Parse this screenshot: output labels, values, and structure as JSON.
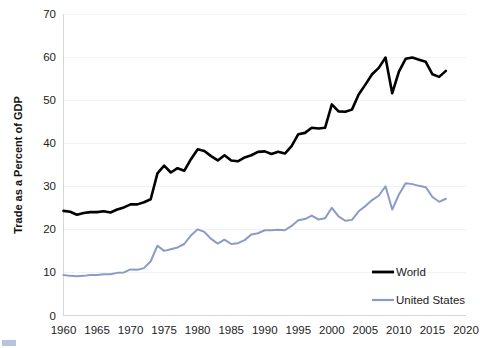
{
  "chart_data": {
    "type": "line",
    "title": "",
    "subtitle": "",
    "xlabel": "",
    "ylabel": "Trade as a Percent of GDP",
    "xlim": [
      1960,
      2020
    ],
    "ylim": [
      0,
      70
    ],
    "x_ticks": [
      1960,
      1965,
      1970,
      1975,
      1980,
      1985,
      1990,
      1995,
      2000,
      2005,
      2010,
      2015,
      2020
    ],
    "y_ticks": [
      0,
      10,
      20,
      30,
      40,
      50,
      60,
      70
    ],
    "grid": true,
    "legend_position": "inside-bottom-right",
    "x": [
      1960,
      1961,
      1962,
      1963,
      1964,
      1965,
      1966,
      1967,
      1968,
      1969,
      1970,
      1971,
      1972,
      1973,
      1974,
      1975,
      1976,
      1977,
      1978,
      1979,
      1980,
      1981,
      1982,
      1983,
      1984,
      1985,
      1986,
      1987,
      1988,
      1989,
      1990,
      1991,
      1992,
      1993,
      1994,
      1995,
      1996,
      1997,
      1998,
      1999,
      2000,
      2001,
      2002,
      2003,
      2004,
      2005,
      2006,
      2007,
      2008,
      2009,
      2010,
      2011,
      2012,
      2013,
      2014,
      2015,
      2016,
      2017
    ],
    "series": [
      {
        "name": "World",
        "color": "#000000",
        "values": [
          24.3,
          24.1,
          23.4,
          23.8,
          24.0,
          24.0,
          24.2,
          23.9,
          24.6,
          25.1,
          25.8,
          25.8,
          26.3,
          27.0,
          33.0,
          34.8,
          33.2,
          34.2,
          33.6,
          36.3,
          38.6,
          38.2,
          37.0,
          36.0,
          37.2,
          36.0,
          35.8,
          36.7,
          37.2,
          38.0,
          38.1,
          37.5,
          38.0,
          37.6,
          39.3,
          42.1,
          42.4,
          43.6,
          43.4,
          43.6,
          49.0,
          47.4,
          47.3,
          47.8,
          51.3,
          53.6,
          56.0,
          57.5,
          59.9,
          51.6,
          56.6,
          59.6,
          59.9,
          59.4,
          58.9,
          56.0,
          55.4,
          56.8
        ]
      },
      {
        "name": "United States",
        "color": "#8a9bc8",
        "values": [
          9.4,
          9.2,
          9.1,
          9.2,
          9.4,
          9.4,
          9.6,
          9.6,
          9.9,
          10.0,
          10.7,
          10.6,
          11.0,
          12.6,
          16.2,
          15.0,
          15.4,
          15.8,
          16.6,
          18.6,
          20.0,
          19.4,
          17.8,
          16.7,
          17.6,
          16.6,
          16.8,
          17.5,
          18.8,
          19.1,
          19.8,
          19.8,
          19.9,
          19.8,
          20.8,
          22.1,
          22.4,
          23.2,
          22.3,
          22.6,
          25.0,
          23.0,
          22.0,
          22.2,
          24.2,
          25.4,
          26.8,
          27.8,
          30.0,
          24.6,
          28.1,
          30.7,
          30.5,
          30.1,
          29.8,
          27.5,
          26.4,
          27.1
        ]
      }
    ],
    "annotations": []
  },
  "legend": {
    "items": [
      {
        "label": "World",
        "color": "#000000"
      },
      {
        "label": "United States",
        "color": "#8a9bc8"
      }
    ]
  },
  "axes": {
    "y_title": "Trade as a Percent of GDP",
    "y_tick_labels": [
      "0",
      "10",
      "20",
      "30",
      "40",
      "50",
      "60",
      "70"
    ],
    "x_tick_labels": [
      "1960",
      "1965",
      "1970",
      "1975",
      "1980",
      "1985",
      "1990",
      "1995",
      "2000",
      "2005",
      "2010",
      "2015",
      "2020"
    ]
  }
}
